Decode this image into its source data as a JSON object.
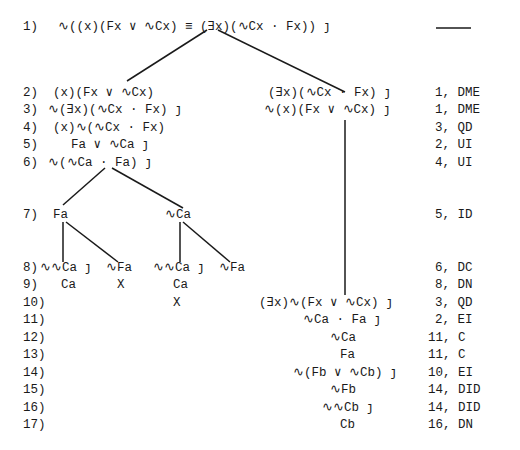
{
  "proof": {
    "line1": {
      "num": "1)",
      "formula": "∿((x)(Fx ∨ ∿Cx) ≡ (∃x)(∿Cx · Fx)) ȷ",
      "justification": "——"
    },
    "left": [
      {
        "num": "2)",
        "formula": "(x)(Fx ∨ ∿Cx)"
      },
      {
        "num": "3)",
        "formula": "∿(∃x)(∿Cx · Fx) ȷ"
      },
      {
        "num": "4)",
        "formula": "(x)∿(∿Cx · Fx)"
      },
      {
        "num": "5)",
        "formula": "Fa ∨ ∿Ca ȷ"
      },
      {
        "num": "6)",
        "formula": "∿(∿Ca · Fa) ȷ"
      }
    ],
    "right_top": [
      {
        "formula": "(∃x)(∿Cx · Fx) ȷ"
      },
      {
        "formula": "∿(x)(Fx ∨ ∿Cx) ȷ"
      }
    ],
    "line7": {
      "num": "7)",
      "left": "Fa",
      "right": "∿Ca"
    },
    "line8": {
      "num": "8)",
      "a": "∿∿Ca ȷ",
      "b": "∿Fa",
      "c": "∿∿Ca ȷ",
      "d": "∿Fa"
    },
    "line9": {
      "num": "9)",
      "a": "Ca",
      "b": "X",
      "c": "Ca"
    },
    "line10": {
      "num": "10)",
      "c": "X",
      "right": "(∃x)∿(Fx ∨ ∿Cx) ȷ"
    },
    "right_bottom": [
      {
        "num": "11)",
        "formula": "∿Ca · Fa ȷ"
      },
      {
        "num": "12)",
        "formula": "∿Ca"
      },
      {
        "num": "13)",
        "formula": "Fa"
      },
      {
        "num": "14)",
        "formula": "∿(Fb ∨ ∿Cb) ȷ"
      },
      {
        "num": "15)",
        "formula": "∿Fb"
      },
      {
        "num": "16)",
        "formula": "∿∿Cb ȷ"
      },
      {
        "num": "17)",
        "formula": "Cb"
      }
    ],
    "justifications": {
      "j2": "1, DME",
      "j3": "1, DME",
      "j4": "3, QD",
      "j5": "2, UI",
      "j6": "4, UI",
      "j7": "5, ID",
      "j8": "6, DC",
      "j9": "8, DN",
      "j10": "3, QD",
      "j11": "2, EI",
      "j12": "11, C",
      "j13": "11, C",
      "j14": "10, EI",
      "j15": "14, DID",
      "j16": "14, DID",
      "j17": "16, DN"
    }
  }
}
